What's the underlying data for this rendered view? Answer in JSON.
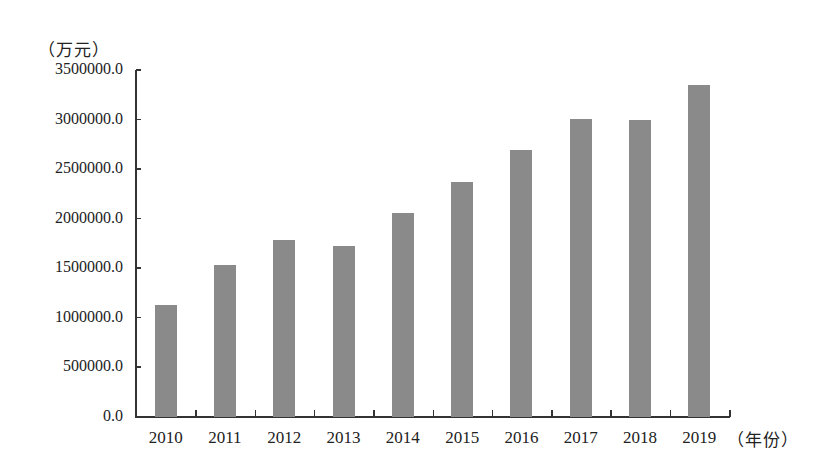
{
  "chart_data": {
    "type": "bar",
    "title": "",
    "xlabel": "（年份）",
    "ylabel": "（万元）",
    "categories": [
      "2010",
      "2011",
      "2012",
      "2013",
      "2014",
      "2015",
      "2016",
      "2017",
      "2018",
      "2019"
    ],
    "values": [
      1130000,
      1530000,
      1786000,
      1725000,
      2058000,
      2371000,
      2694000,
      3007000,
      2997000,
      3350000
    ],
    "ylim": [
      0,
      3500000
    ],
    "yticks": [
      "0.0",
      "500000.0",
      "1000000.0",
      "1500000.0",
      "2000000.0",
      "2500000.0",
      "3000000.0",
      "3500000.0"
    ],
    "ytick_values": [
      0,
      500000,
      1000000,
      1500000,
      2000000,
      2500000,
      3000000,
      3500000
    ],
    "grid": false,
    "legend": null,
    "bar_color": "#8a8a8a"
  }
}
